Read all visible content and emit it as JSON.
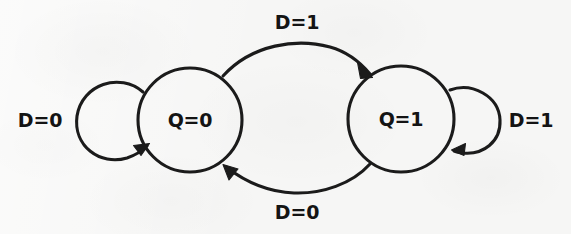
{
  "diagram": {
    "type": "state-transition-diagram",
    "background_color": "#f6f6f5",
    "stroke_color": "#1b1b1b",
    "states": [
      {
        "id": "state-q0",
        "label": "Q=0",
        "cx": 190,
        "cy": 120,
        "r": 52
      },
      {
        "id": "state-q1",
        "label": "Q=1",
        "cx": 401,
        "cy": 119,
        "r": 53
      }
    ],
    "transitions": [
      {
        "id": "transition-q0-to-q1",
        "label": "D=1",
        "from": "state-q0",
        "to": "state-q1",
        "kind": "arc",
        "position": "top",
        "label_x": 297,
        "label_y": 22
      },
      {
        "id": "transition-q1-to-q0",
        "label": "D=0",
        "from": "state-q1",
        "to": "state-q0",
        "kind": "arc",
        "position": "bottom",
        "label_x": 297,
        "label_y": 212
      },
      {
        "id": "transition-q0-self",
        "label": "D=0",
        "from": "state-q0",
        "to": "state-q0",
        "kind": "self-loop",
        "position": "left",
        "label_x": 40,
        "label_y": 126
      },
      {
        "id": "transition-q1-self",
        "label": "D=1",
        "from": "state-q1",
        "to": "state-q1",
        "kind": "self-loop",
        "position": "right",
        "label_x": 531,
        "label_y": 126
      }
    ]
  }
}
